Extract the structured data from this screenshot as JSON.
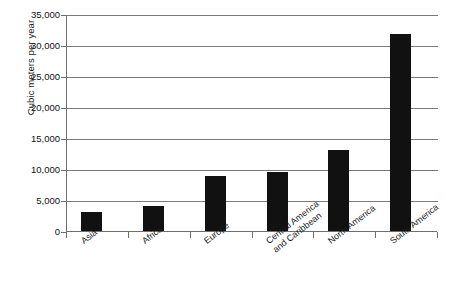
{
  "chart_data": {
    "type": "bar",
    "title": "",
    "subtitle": "",
    "xlabel": "",
    "ylabel": "Cubic meters per year",
    "ylim": [
      0,
      35000
    ],
    "ytick_values": [
      0,
      5000,
      10000,
      15000,
      20000,
      25000,
      30000,
      35000
    ],
    "ytick_labels": [
      "0",
      "5,000",
      "10,000",
      "15,000",
      "20,000",
      "25,000",
      "30,000",
      "35,000"
    ],
    "grid": "horizontal",
    "legend": "none",
    "bar_color": "#111111",
    "axis_color": "#6e6e6e",
    "categories": [
      "Asia",
      "Africa",
      "Europe",
      "Central America and Caribbean",
      "North America",
      "South America"
    ],
    "category_lines": [
      [
        "Asia"
      ],
      [
        "Africa"
      ],
      [
        "Europe"
      ],
      [
        "Central America",
        "and Caribbean"
      ],
      [
        "North America"
      ],
      [
        "South America"
      ]
    ],
    "values": [
      3000,
      4000,
      8800,
      9500,
      13000,
      31700
    ]
  }
}
